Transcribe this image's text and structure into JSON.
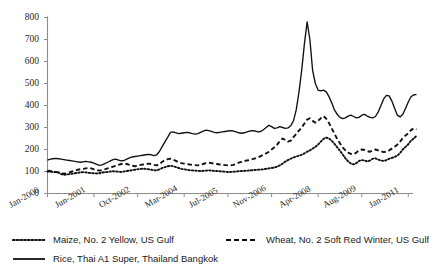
{
  "chart_data": {
    "type": "line",
    "title": "",
    "xlabel": "",
    "ylabel": "",
    "ylim": [
      0,
      800
    ],
    "ytick_values": [
      0,
      100,
      200,
      300,
      400,
      500,
      600,
      700,
      800
    ],
    "ytick_labels": [
      "0",
      "100",
      "200",
      "300",
      "400",
      "500",
      "600",
      "700",
      "800"
    ],
    "grid": false,
    "legend_position": "below",
    "xtick_labels": [
      "Jan-2000",
      "Jun-2001",
      "Oct-2002",
      "Mar-2004",
      "Jul-2005",
      "Nov-2006",
      "Apr-2008",
      "Aug-2009",
      "Jan-2011"
    ],
    "xtick_index": [
      0,
      17,
      33,
      50,
      66,
      82,
      99,
      115,
      132
    ],
    "x_count": 134,
    "series": [
      {
        "name": "Maize, No. 2 Yellow, US Gulf",
        "style": "dotted",
        "color": "#111111",
        "values": [
          100,
          99,
          98,
          97,
          96,
          88,
          85,
          86,
          88,
          90,
          92,
          94,
          96,
          97,
          96,
          94,
          93,
          92,
          91,
          92,
          95,
          97,
          98,
          100,
          101,
          100,
          99,
          98,
          100,
          102,
          104,
          106,
          108,
          110,
          112,
          113,
          112,
          110,
          108,
          106,
          105,
          110,
          116,
          120,
          124,
          126,
          124,
          120,
          116,
          112,
          110,
          108,
          106,
          105,
          104,
          103,
          102,
          103,
          104,
          105,
          104,
          103,
          102,
          101,
          100,
          99,
          98,
          98,
          99,
          100,
          101,
          102,
          103,
          104,
          105,
          106,
          107,
          108,
          109,
          110,
          112,
          114,
          116,
          118,
          122,
          128,
          136,
          145,
          152,
          158,
          164,
          168,
          172,
          176,
          182,
          190,
          196,
          204,
          212,
          222,
          236,
          248,
          254,
          250,
          240,
          226,
          210,
          194,
          178,
          160,
          146,
          136,
          132,
          138,
          148,
          152,
          150,
          146,
          150,
          158,
          160,
          154,
          150,
          148,
          152,
          158,
          162,
          166,
          172,
          184,
          200,
          212,
          224,
          240,
          250,
          262
        ]
      },
      {
        "name": "Wheat, No. 2 Soft Red Winter, US Gulf",
        "style": "dashed",
        "color": "#111111",
        "values": [
          104,
          102,
          100,
          98,
          96,
          92,
          90,
          92,
          96,
          100,
          104,
          108,
          110,
          112,
          114,
          116,
          114,
          110,
          106,
          104,
          106,
          110,
          114,
          118,
          122,
          126,
          130,
          134,
          136,
          134,
          130,
          126,
          124,
          126,
          130,
          132,
          134,
          136,
          134,
          130,
          128,
          134,
          144,
          152,
          156,
          158,
          154,
          148,
          142,
          138,
          136,
          134,
          132,
          130,
          129,
          128,
          130,
          134,
          138,
          140,
          138,
          136,
          134,
          132,
          130,
          129,
          128,
          128,
          130,
          134,
          140,
          144,
          148,
          150,
          152,
          156,
          160,
          164,
          170,
          176,
          182,
          190,
          200,
          210,
          222,
          238,
          250,
          244,
          236,
          240,
          256,
          270,
          286,
          300,
          318,
          336,
          342,
          330,
          322,
          330,
          342,
          352,
          340,
          320,
          296,
          272,
          248,
          228,
          210,
          196,
          186,
          180,
          178,
          186,
          196,
          200,
          198,
          192,
          190,
          196,
          200,
          196,
          192,
          188,
          190,
          196,
          204,
          212,
          222,
          236,
          252,
          264,
          274,
          288,
          296,
          292
        ]
      },
      {
        "name": "Rice, Thai A1 Super, Thailand Bangkok",
        "style": "solid",
        "color": "#111111",
        "values": [
          152,
          156,
          158,
          160,
          158,
          156,
          154,
          152,
          150,
          148,
          146,
          144,
          142,
          144,
          146,
          144,
          142,
          138,
          132,
          128,
          130,
          136,
          142,
          148,
          154,
          156,
          152,
          148,
          150,
          156,
          162,
          166,
          168,
          170,
          172,
          174,
          176,
          178,
          176,
          172,
          176,
          192,
          214,
          236,
          256,
          278,
          280,
          276,
          272,
          274,
          276,
          278,
          276,
          272,
          270,
          272,
          278,
          284,
          288,
          286,
          282,
          278,
          276,
          278,
          280,
          282,
          284,
          286,
          284,
          280,
          276,
          274,
          276,
          280,
          284,
          286,
          284,
          280,
          282,
          290,
          300,
          310,
          304,
          296,
          298,
          304,
          300,
          296,
          298,
          308,
          330,
          380,
          460,
          560,
          680,
          780,
          700,
          560,
          500,
          470,
          466,
          470,
          462,
          440,
          412,
          380,
          360,
          346,
          340,
          344,
          352,
          356,
          350,
          344,
          346,
          356,
          360,
          352,
          346,
          344,
          350,
          370,
          400,
          430,
          446,
          444,
          420,
          388,
          356,
          348,
          360,
          386,
          416,
          440,
          448,
          450
        ]
      }
    ]
  },
  "legend": {
    "items": [
      {
        "label": "Maize, No. 2 Yellow, US Gulf",
        "style": "dotted"
      },
      {
        "label": "Wheat, No. 2 Soft Red Winter, US Gulf",
        "style": "dashed"
      },
      {
        "label": "Rice, Thai A1 Super, Thailand  Bangkok",
        "style": "solid"
      }
    ]
  }
}
